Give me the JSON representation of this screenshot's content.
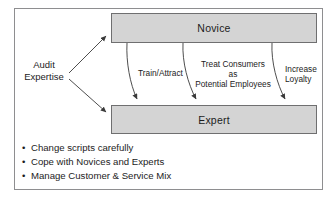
{
  "figure": {
    "colors": {
      "box_fill": "#d4d4d4",
      "box_border": "#6f6f70",
      "frame_border": "#8e8e90",
      "text": "#1c1c1c",
      "arrow": "#3a3a3a"
    },
    "nodes": [
      {
        "id": "novice",
        "label": "Novice"
      },
      {
        "id": "expert",
        "label": "Expert"
      }
    ],
    "source": {
      "line1": "Audit",
      "line2": "Expertise"
    },
    "edge_labels": {
      "train": "Train/Attract",
      "treat_line1": "Treat Consumers",
      "treat_line2": "as",
      "treat_line3": "Potential Employees",
      "increase_line1": "Increase",
      "increase_line2": "Loyalty"
    },
    "bullets": [
      {
        "marker": "•",
        "text": "Change scripts carefully"
      },
      {
        "marker": "•",
        "text": "Cope with Novices and Experts"
      },
      {
        "marker": "•",
        "text": "Manage Customer & Service Mix"
      }
    ]
  }
}
